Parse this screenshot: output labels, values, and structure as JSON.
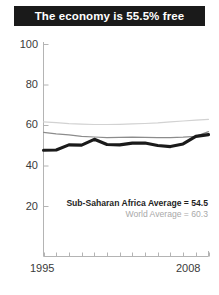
{
  "title": {
    "text": "The economy is 55.5% free"
  },
  "legend": {
    "region_label": "Sub-Saharan Africa Average = 54.5",
    "world_label": "World Average = 60.3"
  },
  "colors": {
    "banner_background": "#1a1a1a",
    "banner_text": "#ffffff",
    "country_line": "#1a1a1a",
    "region_line": "#8c8c8c",
    "world_line": "#d2d2d2",
    "axis": "#b4b4b4",
    "tick_text": "#3a3a3a"
  },
  "chart_data": {
    "type": "line",
    "title": "The economy is 55.5% free",
    "xlabel": "",
    "ylabel": "",
    "xlim": [
      1995,
      2008
    ],
    "ylim": [
      10,
      100
    ],
    "grid": false,
    "legend_position": "inside-bottom-right",
    "x": [
      1995,
      1996,
      1997,
      1998,
      1999,
      2000,
      2001,
      2002,
      2003,
      2004,
      2005,
      2006,
      2007,
      2008
    ],
    "xticks": [
      1995,
      1996,
      1997,
      1998,
      1999,
      2000,
      2001,
      2002,
      2003,
      2004,
      2005,
      2006,
      2007,
      2008
    ],
    "xtick_labels_shown": [
      "1995",
      "2008"
    ],
    "yticks": [
      20,
      40,
      60,
      80,
      100
    ],
    "ytick_labels": [
      "20",
      "40",
      "60",
      "80",
      "100"
    ],
    "series": [
      {
        "name": "Country score",
        "color": "#1a1a1a",
        "width": 3.1,
        "values": [
          47.8,
          47.9,
          50.4,
          50.3,
          53.2,
          50.6,
          50.4,
          51.3,
          51.3,
          50.1,
          49.6,
          50.9,
          54.6,
          55.5
        ]
      },
      {
        "name": "Sub-Saharan Africa Average",
        "color": "#8c8c8c",
        "width": 1.2,
        "values": [
          56.6,
          55.9,
          55.4,
          54.6,
          54.3,
          54.0,
          54.1,
          54.2,
          54.1,
          54.0,
          54.0,
          54.2,
          54.6,
          57.0
        ]
      },
      {
        "name": "World Average",
        "color": "#d2d2d2",
        "width": 1.2,
        "values": [
          61.8,
          61.4,
          60.9,
          60.7,
          60.5,
          60.5,
          60.6,
          60.8,
          61.0,
          61.3,
          61.8,
          62.2,
          62.6,
          63.0
        ]
      }
    ],
    "annotations": [
      {
        "text": "Sub-Saharan Africa Average = 54.5",
        "value": 54.5
      },
      {
        "text": "World Average = 60.3",
        "value": 60.3
      }
    ]
  },
  "axis_labels": {
    "y": [
      "100",
      "80",
      "60",
      "40",
      "20"
    ],
    "x_start": "1995",
    "x_end": "2008"
  }
}
